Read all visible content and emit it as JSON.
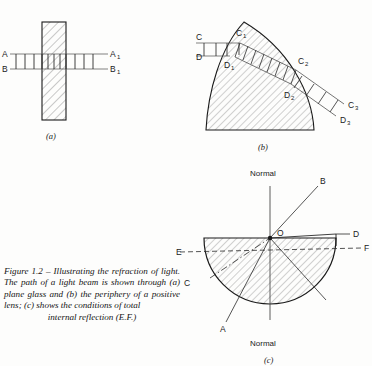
{
  "figure": {
    "caption_body": "Figure 1.2 – Illustrating the refraction of light. The path of a light beam is shown through (a) plane glass and (b) the periphery of a positive lens; (c) shows the conditions of total",
    "caption_last_line": "internal reflection (E.F.)"
  },
  "panel_a": {
    "label": "(a)",
    "incident_upper": "A",
    "incident_lower": "B",
    "emergent_upper": "A",
    "emergent_upper_sub": "1",
    "emergent_lower": "B",
    "emergent_lower_sub": "1",
    "medium": "plane glass block",
    "wavefront_count_before": 4,
    "wavefront_count_inside": 4,
    "wavefront_count_after": 3
  },
  "panel_b": {
    "label": "(b)",
    "incident_upper": "C",
    "incident_lower": "D",
    "entry_upper": "C",
    "entry_upper_sub": "1",
    "entry_lower": "D",
    "entry_lower_sub": "1",
    "mid_upper": "C",
    "mid_upper_sub": "2",
    "mid_lower": "D",
    "mid_lower_sub": "2",
    "exit_upper": "C",
    "exit_upper_sub": "3",
    "exit_lower": "D",
    "exit_lower_sub": "3",
    "medium": "periphery of a positive lens"
  },
  "panel_c": {
    "label": "(c)",
    "normal_top": "Normal",
    "normal_bottom": "Normal",
    "centre_point": "O",
    "ray_a": "A",
    "ray_b": "B",
    "ray_c": "C",
    "ray_d": "D",
    "ray_e": "E",
    "ray_f": "F",
    "medium": "semicircular glass block",
    "condition": "total internal reflection"
  },
  "colors": {
    "ink": "#1a1a1a",
    "hatch": "#6f6f6f",
    "ray": "#2a2a2a",
    "paper": "#fdfdfc"
  }
}
